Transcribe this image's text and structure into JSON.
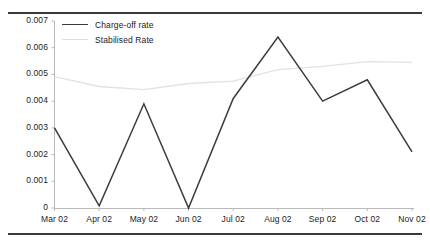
{
  "chart_data": {
    "type": "line",
    "title": "",
    "xlabel": "",
    "ylabel": "",
    "categories": [
      "Mar 02",
      "Apr 02",
      "May 02",
      "Jun 02",
      "Jul 02",
      "Aug 02",
      "Sep 02",
      "Oct 02",
      "Nov 02"
    ],
    "ylim": [
      0,
      0.007
    ],
    "xlim_categories": 9,
    "ytick_labels": [
      "0.007",
      "0.006",
      "0.005",
      "0.004",
      "0.003",
      "0.002",
      "0.001",
      "0"
    ],
    "ytick_values": [
      0.007,
      0.006,
      0.005,
      0.004,
      0.003,
      0.002,
      0.001,
      0
    ],
    "grid": false,
    "legend_position": "top-left",
    "series": [
      {
        "name": "Charge-off rate",
        "color": "#3c3c3c",
        "values": [
          0.003,
          8e-05,
          0.0039,
          0.0,
          0.0041,
          0.0064,
          0.004,
          0.0048,
          0.0021
        ]
      },
      {
        "name": "Stabilised Rate",
        "color": "#e2e2e2",
        "values": [
          0.00492,
          0.00455,
          0.00443,
          0.00466,
          0.00475,
          0.00518,
          0.0053,
          0.00548,
          0.00545
        ]
      }
    ]
  },
  "legend": {
    "items": [
      {
        "label": "Charge-off rate"
      },
      {
        "label": "Stabilised Rate"
      }
    ]
  },
  "axes": {
    "y_labels": [
      "0.007",
      "0.006",
      "0.005",
      "0.004",
      "0.003",
      "0.002",
      "0.001",
      "0"
    ],
    "x_labels": [
      "Mar 02",
      "Apr 02",
      "May 02",
      "Jun 02",
      "Jul 02",
      "Aug 02",
      "Sep 02",
      "Oct 02",
      "Nov 02"
    ]
  },
  "colors": {
    "charge_off_line": "#3c3c3c",
    "stabilised_line": "#e2e2e2",
    "axis": "#b9b9b9",
    "rule": "#3a3a3a",
    "text": "#1c1c1c"
  }
}
